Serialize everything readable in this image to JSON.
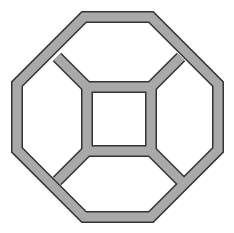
{
  "diagram": {
    "colors": {
      "fill": "#a9a9a9",
      "edge": "#333333",
      "background": "#ffffff"
    },
    "outer_octagon": [
      [
        84,
        17
      ],
      [
        151,
        17
      ],
      [
        218,
        84
      ],
      [
        218,
        150
      ],
      [
        151,
        217
      ],
      [
        84,
        217
      ],
      [
        17,
        150
      ],
      [
        17,
        84
      ]
    ],
    "inner_square": [
      [
        87,
        87
      ],
      [
        151,
        87
      ],
      [
        151,
        151
      ],
      [
        87,
        151
      ]
    ],
    "connectors": [
      [
        [
          57,
          57
        ],
        [
          87,
          87
        ]
      ],
      [
        [
          181,
          57
        ],
        [
          151,
          87
        ]
      ],
      [
        [
          181,
          181
        ],
        [
          151,
          151
        ]
      ],
      [
        [
          57,
          181
        ],
        [
          87,
          151
        ]
      ]
    ]
  }
}
